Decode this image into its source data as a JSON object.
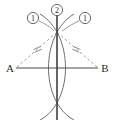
{
  "figure": {
    "canvas": {
      "width": 114,
      "height": 120,
      "background": "#ffffff"
    },
    "colors": {
      "solid_stroke": "#4a4a4a",
      "arc_stroke": "#6e6e6e",
      "dashed_stroke": "#9a9a9a",
      "label_fill": "#2b2b2b",
      "circle_stroke": "#5a5a5a"
    },
    "endpoint_labels": {
      "left": "A",
      "right": "B"
    },
    "step_labels": {
      "left_arc": "1",
      "vertical_line": "2",
      "right_arc": "1"
    },
    "geometry": {
      "segment_ab": {
        "x1": 16,
        "y1": 68,
        "x2": 98,
        "y2": 68
      },
      "point_a": {
        "x": 16,
        "y": 68
      },
      "point_b": {
        "x": 98,
        "y": 68
      },
      "apex_top": {
        "x": 57,
        "y": 33
      },
      "apex_bottom": {
        "x": 57,
        "y": 103
      },
      "vertical_line": {
        "x1": 57,
        "y1": 14,
        "x2": 57,
        "y2": 120
      },
      "arc_left_crossing_x": 48,
      "arc_right_crossing_x": 67,
      "tick_left": {
        "x": 37,
        "y": 50
      },
      "tick_right": {
        "x": 77,
        "y": 50
      }
    },
    "callouts": [
      {
        "name": "left-arc-callout",
        "text": "1",
        "cx": 33,
        "cy": 18,
        "r": 6,
        "leader_to": {
          "x": 50,
          "y": 30
        }
      },
      {
        "name": "vertical-line-callout",
        "text": "2",
        "cx": 57,
        "cy": 10,
        "r": 6
      },
      {
        "name": "right-arc-callout",
        "text": "1",
        "cx": 85,
        "cy": 18,
        "r": 6,
        "leader_to": {
          "x": 66,
          "y": 30
        }
      }
    ]
  }
}
